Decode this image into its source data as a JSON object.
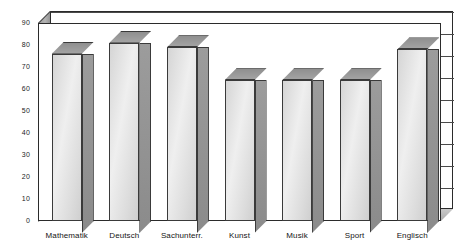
{
  "chart_data": {
    "type": "bar",
    "title": "",
    "subtitle": "",
    "xlabel": "",
    "ylabel": "",
    "categories": [
      "Mathematik",
      "Deutsch",
      "Sachunterr.",
      "Kunst",
      "Musik",
      "Sport",
      "Englisch"
    ],
    "values": [
      76,
      81,
      79,
      64,
      64,
      64,
      78
    ],
    "series": [
      {
        "name": "",
        "values": [
          76,
          81,
          79,
          64,
          64,
          64,
          78
        ]
      }
    ],
    "ylim": [
      0,
      90
    ],
    "ytick_labels": [
      "0",
      "10",
      "20",
      "30",
      "40",
      "50",
      "60",
      "70",
      "80",
      "90"
    ],
    "ytick_values": [
      0,
      10,
      20,
      30,
      40,
      50,
      60,
      70,
      80,
      90
    ],
    "grid": true,
    "grid_axis": "y",
    "legend": false,
    "legend_position": "none",
    "three_d": true,
    "annotations": []
  },
  "colors": {
    "bar_face_light": "#efefef",
    "bar_face_dark": "#cfcfcf",
    "bar_side": "#909090",
    "bar_top": "#9a9a9a",
    "outline": "#3a3a3a",
    "gridline": "#4a4a4a",
    "wall": "#aeaeae",
    "floor": "#b8b8b8",
    "text": "#141414",
    "background": "#ffffff"
  }
}
